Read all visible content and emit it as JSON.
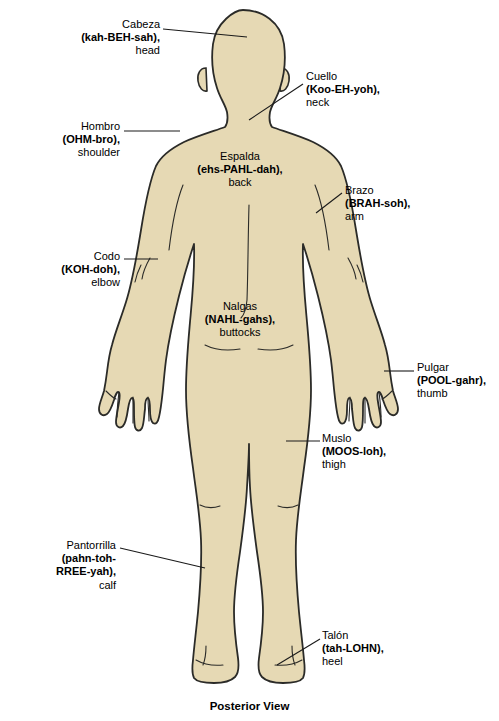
{
  "figure": {
    "caption": "Posterior View",
    "skin_color": "#e6d9b4",
    "outline_color": "#2b2b28",
    "leader_line_color": "#1a1a1a",
    "background_color": "#ffffff"
  },
  "labels": [
    {
      "id": "cabeza",
      "term": "Cabeza",
      "pronunciation": "(kah-BEH-sah),",
      "english": "head",
      "align": "right"
    },
    {
      "id": "cuello",
      "term": "Cuello",
      "pronunciation": "(Koo-EH-yoh),",
      "english": "neck",
      "align": "left"
    },
    {
      "id": "hombro",
      "term": "Hombro",
      "pronunciation": "(OHM-bro),",
      "english": "shoulder",
      "align": "right"
    },
    {
      "id": "espalda",
      "term": "Espalda",
      "pronunciation": "(ehs-PAHL-dah),",
      "english": "back",
      "align": "center"
    },
    {
      "id": "brazo",
      "term": "Brazo",
      "pronunciation": "(BRAH-soh),",
      "english": "arm",
      "align": "left"
    },
    {
      "id": "codo",
      "term": "Codo",
      "pronunciation": "(KOH-doh),",
      "english": "elbow",
      "align": "right"
    },
    {
      "id": "nalgas",
      "term": "Nalgas",
      "pronunciation": "(NAHL-gahs),",
      "english": "buttocks",
      "align": "center"
    },
    {
      "id": "pulgar",
      "term": "Pulgar",
      "pronunciation": "(POOL-gahr),",
      "english": "thumb",
      "align": "left"
    },
    {
      "id": "muslo",
      "term": "Muslo",
      "pronunciation": "(MOOS-loh),",
      "english": "thigh",
      "align": "left"
    },
    {
      "id": "pantorrilla",
      "term": "Pantorrilla",
      "pronunciation": "(pahn-toh-",
      "pronunciation2": "RREE-yah),",
      "english": "calf",
      "align": "right"
    },
    {
      "id": "talon",
      "term": "Talón",
      "pronunciation": "(tah-LOHN),",
      "english": "heel",
      "align": "left"
    }
  ]
}
